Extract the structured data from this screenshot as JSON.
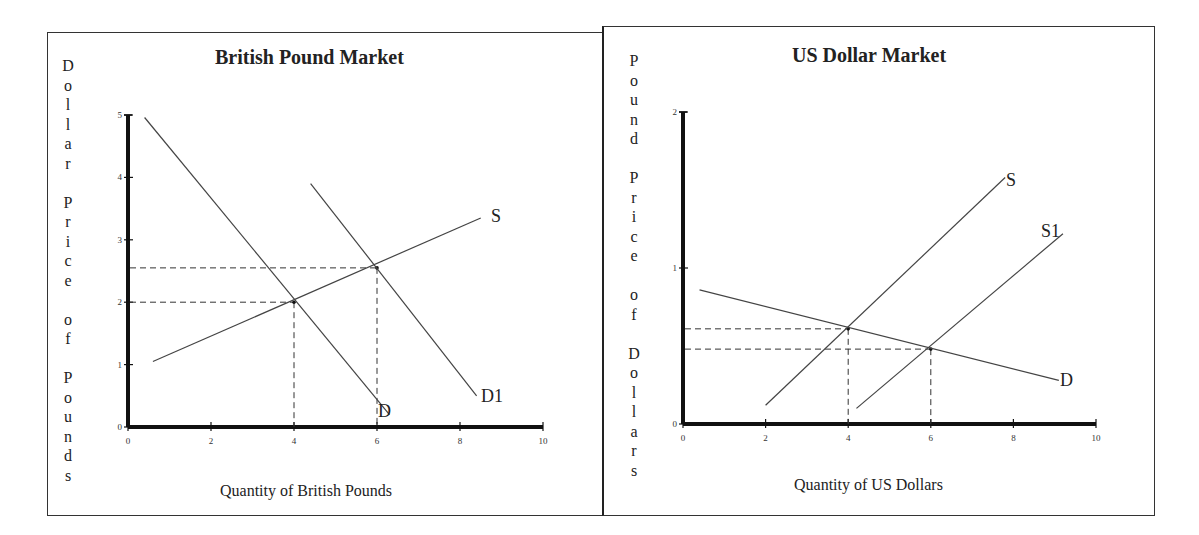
{
  "chart_data": [
    {
      "type": "line",
      "title": "British Pound Market",
      "xlabel": "Quantity of British Pounds",
      "ylabel": "Dollar Price of Pounds",
      "xlim": [
        0,
        10
      ],
      "ylim": [
        0,
        5
      ],
      "x_ticks": [
        "0",
        "2",
        "4",
        "6",
        "8",
        "10"
      ],
      "y_ticks": [
        "0",
        "1",
        "2",
        "3",
        "4",
        "5"
      ],
      "grid": false,
      "legend": "none (inline curve labels)",
      "series": [
        {
          "name": "D",
          "points": [
            [
              0.4,
              4.96
            ],
            [
              6.3,
              0.2
            ]
          ]
        },
        {
          "name": "D1",
          "points": [
            [
              4.4,
              3.9
            ],
            [
              8.4,
              0.5
            ]
          ]
        },
        {
          "name": "S",
          "points": [
            [
              0.6,
              1.05
            ],
            [
              8.5,
              3.35
            ]
          ]
        }
      ],
      "equilibria": [
        {
          "between": [
            "S",
            "D"
          ],
          "x": 4,
          "y": 2
        },
        {
          "between": [
            "S",
            "D1"
          ],
          "x": 6,
          "y": 2.55
        }
      ],
      "reference_lines": "dashed lines from equilibria to both axes"
    },
    {
      "type": "line",
      "title": "US Dollar Market",
      "xlabel": "Quantity of US Dollars",
      "ylabel": "Pound Price of Dollars",
      "xlim": [
        0,
        10
      ],
      "ylim": [
        0,
        2
      ],
      "x_ticks": [
        "0",
        "2",
        "4",
        "6",
        "8",
        "10"
      ],
      "y_ticks": [
        "0",
        "1",
        "2"
      ],
      "grid": false,
      "legend": "none (inline curve labels)",
      "series": [
        {
          "name": "D",
          "points": [
            [
              0.4,
              0.86
            ],
            [
              9.1,
              0.28
            ]
          ]
        },
        {
          "name": "S",
          "points": [
            [
              2.0,
              0.12
            ],
            [
              7.8,
              1.58
            ]
          ]
        },
        {
          "name": "S1",
          "points": [
            [
              4.2,
              0.1
            ],
            [
              9.2,
              1.22
            ]
          ]
        }
      ],
      "equilibria": [
        {
          "between": [
            "S",
            "D"
          ],
          "x": 4,
          "y": 0.61
        },
        {
          "between": [
            "S1",
            "D"
          ],
          "x": 6,
          "y": 0.48
        }
      ],
      "reference_lines": "dashed lines from equilibria to both axes"
    }
  ],
  "left": {
    "title": "British Pound Market",
    "xlabel": "Quantity of British Pounds",
    "ylabel_words": [
      "Dollar",
      "Price",
      "of",
      "Pounds"
    ],
    "labels": {
      "D": "D",
      "D1": "D1",
      "S": "S"
    }
  },
  "right": {
    "title": "US Dollar Market",
    "xlabel": "Quantity of US Dollars",
    "ylabel_words": [
      "Pound",
      "Price",
      "of",
      "Dollars"
    ],
    "labels": {
      "D": "D",
      "S": "S",
      "S1": "S1"
    }
  }
}
